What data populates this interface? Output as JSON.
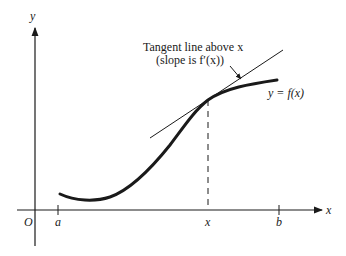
{
  "diagram": {
    "annotation_line1": "Tangent line above x",
    "annotation_line2": "(slope is f′(x))",
    "curve_label": "y = f(x)",
    "axes": {
      "x_label": "x",
      "y_label": "y",
      "origin_label": "O"
    },
    "ticks": [
      {
        "label": "a"
      },
      {
        "label": "x"
      },
      {
        "label": "b"
      }
    ],
    "colors": {
      "ink": "#1a1a1a",
      "background": "#ffffff"
    }
  }
}
